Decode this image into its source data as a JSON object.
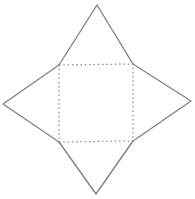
{
  "figure": {
    "name": "square-pyramid-net",
    "background_color": "#ffffff",
    "solid_line_color": "#848484",
    "dotted_line_color": "#919191",
    "vertices": {
      "square_top_left": "59,65",
      "square_top_right": "133,64",
      "square_bottom_right": "133,141",
      "square_bottom_left": "59,142",
      "apex_top": "97,5",
      "apex_right": "191,101",
      "apex_bottom": "96,194",
      "apex_left": "3,104"
    },
    "polylines": {
      "square_dotted": "59,65 133,64 133,141 59,142 59,65",
      "triangle_top": "59,65 97,5 133,64",
      "triangle_right": "133,64 191,101 133,141",
      "triangle_bottom": "133,141 96,194 59,142",
      "triangle_left": "59,142 3,104 59,65"
    }
  }
}
